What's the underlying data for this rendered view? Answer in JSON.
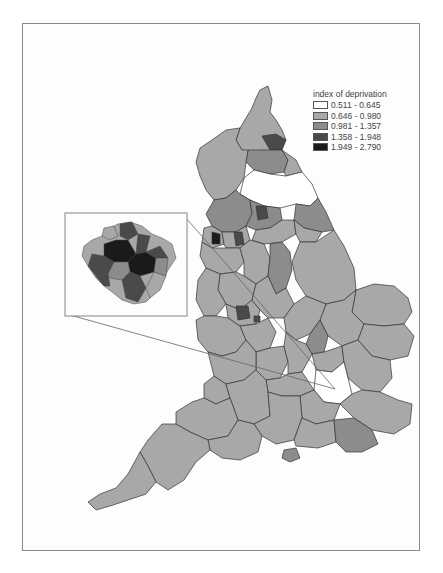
{
  "figure": {
    "type": "choropleth map",
    "region": "England",
    "inset_region": "Greater London"
  },
  "legend": {
    "title": "index of deprivation",
    "classes": [
      {
        "range": "0.511 - 0.645",
        "color": "#ffffff"
      },
      {
        "range": "0.646 - 0.980",
        "color": "#a8a8a8"
      },
      {
        "range": "0.981 - 1.357",
        "color": "#8c8c8c"
      },
      {
        "range": "1.358 - 1.948",
        "color": "#4a4a4a"
      },
      {
        "range": "1.949 - 2.790",
        "color": "#1a1a1a"
      }
    ]
  },
  "colors": {
    "border": "#333333",
    "frame": "#8a8a8a",
    "leader_line": "#666666"
  }
}
